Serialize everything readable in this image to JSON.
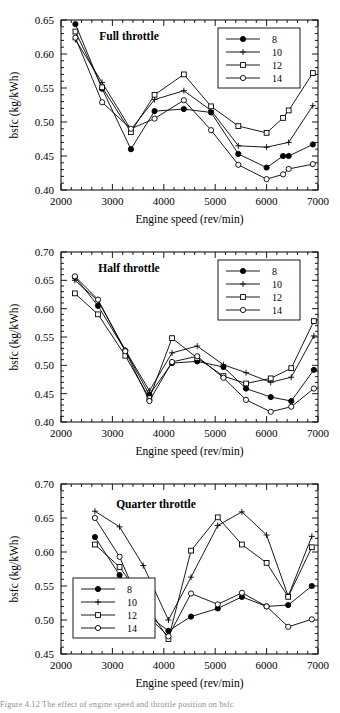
{
  "figure": {
    "caption": "Figure 4.12   The effect of engine speed and throttle position on bsfc"
  },
  "chart_data": [
    {
      "type": "line",
      "title": "Full  throttle",
      "xlabel": "Engine speed (rev/min)",
      "ylabel": "bsfc (kg/kWh)",
      "xlim": [
        2000,
        7000
      ],
      "ylim": [
        0.4,
        0.65
      ],
      "xticks": [
        2000,
        3000,
        4000,
        5000,
        6000,
        7000
      ],
      "yticks": [
        0.4,
        0.45,
        0.5,
        0.55,
        0.6,
        0.65
      ],
      "xticklabels": [
        "2000",
        "3000",
        "4000",
        "5000",
        "6000",
        "7000"
      ],
      "yticklabels": [
        "0.40",
        "0.45",
        "0.50",
        "0.55",
        "0.60",
        "0.65"
      ],
      "grid": false,
      "legend_position": "top-right",
      "series": [
        {
          "name": "8",
          "marker": "filled-circle",
          "x": [
            2280,
            2800,
            3360,
            3820,
            4390,
            4920,
            5450,
            6000,
            6320,
            6430,
            6900
          ],
          "y": [
            0.644,
            0.549,
            0.46,
            0.516,
            0.519,
            0.514,
            0.453,
            0.433,
            0.45,
            0.45,
            0.467
          ]
        },
        {
          "name": "10",
          "marker": "plus",
          "x": [
            2280,
            2800,
            3360,
            3820,
            4390,
            4920,
            5450,
            6000,
            6430,
            6900
          ],
          "y": [
            0.621,
            0.558,
            0.489,
            0.533,
            0.546,
            0.517,
            0.465,
            0.463,
            0.47,
            0.524
          ]
        },
        {
          "name": "12",
          "marker": "square",
          "x": [
            2280,
            2800,
            3360,
            3820,
            4390,
            4920,
            5450,
            6000,
            6320,
            6430,
            6900
          ],
          "y": [
            0.633,
            0.551,
            0.485,
            0.54,
            0.57,
            0.523,
            0.494,
            0.484,
            0.506,
            0.517,
            0.572
          ]
        },
        {
          "name": "14",
          "marker": "open-circle",
          "x": [
            2280,
            2800,
            3360,
            3820,
            4390,
            4920,
            5450,
            6000,
            6320,
            6430,
            6900
          ],
          "y": [
            0.624,
            0.529,
            0.49,
            0.505,
            0.532,
            0.488,
            0.437,
            0.416,
            0.423,
            0.431,
            0.438
          ]
        }
      ]
    },
    {
      "type": "line",
      "title": "Half  throttle",
      "xlabel": "Engine speed (rev/min)",
      "ylabel": "bsfc (kg/kWh)",
      "xlim": [
        2000,
        7000
      ],
      "ylim": [
        0.4,
        0.7
      ],
      "xticks": [
        2000,
        3000,
        4000,
        5000,
        6000,
        7000
      ],
      "yticks": [
        0.4,
        0.45,
        0.5,
        0.55,
        0.6,
        0.65,
        0.7
      ],
      "xticklabels": [
        "2000",
        "3000",
        "4000",
        "5000",
        "6000",
        "7000"
      ],
      "yticklabels": [
        "0.40",
        "0.45",
        "0.50",
        "0.55",
        "0.60",
        "0.65",
        "0.70"
      ],
      "grid": false,
      "legend_position": "top-right",
      "series": [
        {
          "name": "8",
          "marker": "filled-circle",
          "x": [
            2270,
            2720,
            3250,
            3720,
            4160,
            4650,
            5160,
            5600,
            6080,
            6480,
            6920
          ],
          "y": [
            0.656,
            0.605,
            0.526,
            0.448,
            0.504,
            0.507,
            0.497,
            0.459,
            0.444,
            0.437,
            0.492
          ]
        },
        {
          "name": "10",
          "marker": "plus",
          "x": [
            2270,
            2720,
            3250,
            3720,
            4160,
            4650,
            5160,
            5600,
            6080,
            6480,
            6920
          ],
          "y": [
            0.65,
            0.614,
            0.527,
            0.455,
            0.522,
            0.534,
            0.501,
            0.487,
            0.47,
            0.479,
            0.552
          ]
        },
        {
          "name": "12",
          "marker": "square",
          "x": [
            2270,
            2720,
            3250,
            3720,
            4160,
            4650,
            5160,
            5600,
            6080,
            6480,
            6920
          ],
          "y": [
            0.627,
            0.59,
            0.517,
            0.442,
            0.548,
            0.513,
            0.481,
            0.468,
            0.477,
            0.495,
            0.578
          ]
        },
        {
          "name": "14",
          "marker": "open-circle",
          "x": [
            2270,
            2720,
            3250,
            3720,
            4160,
            4650,
            5160,
            5600,
            6080,
            6480,
            6920
          ],
          "y": [
            0.657,
            0.616,
            0.525,
            0.437,
            0.506,
            0.516,
            0.478,
            0.439,
            0.418,
            0.427,
            0.459
          ]
        }
      ]
    },
    {
      "type": "line",
      "title": "Quarter  throttle",
      "xlabel": "Engine speed (rev/min)",
      "ylabel": "bsfc (kg/kWh)",
      "xlim": [
        2000,
        7000
      ],
      "ylim": [
        0.45,
        0.7
      ],
      "xticks": [
        2000,
        3000,
        4000,
        5000,
        6000,
        7000
      ],
      "yticks": [
        0.45,
        0.5,
        0.55,
        0.6,
        0.65,
        0.7
      ],
      "xticklabels": [
        "2000",
        "3000",
        "4000",
        "5000",
        "6000",
        "7000"
      ],
      "yticklabels": [
        "0.45",
        "0.50",
        "0.55",
        "0.60",
        "0.65",
        "0.70"
      ],
      "grid": false,
      "legend_position": "bottom-left",
      "series": [
        {
          "name": "8",
          "marker": "filled-circle",
          "x": [
            2660,
            3140,
            3600,
            4090,
            4530,
            5050,
            5520,
            6000,
            6420,
            6880
          ],
          "y": [
            0.622,
            0.566,
            0.512,
            0.484,
            0.505,
            0.517,
            0.534,
            0.52,
            0.522,
            0.55
          ]
        },
        {
          "name": "10",
          "marker": "plus",
          "x": [
            2660,
            3140,
            3600,
            4090,
            4530,
            5050,
            5520,
            6000,
            6420,
            6880
          ],
          "y": [
            0.66,
            0.637,
            0.58,
            0.5,
            0.563,
            0.639,
            0.659,
            0.625,
            0.535,
            0.623
          ]
        },
        {
          "name": "12",
          "marker": "square",
          "x": [
            2660,
            3140,
            3600,
            4090,
            4530,
            5050,
            5520,
            6000,
            6420,
            6880
          ],
          "y": [
            0.611,
            0.578,
            0.529,
            0.472,
            0.602,
            0.651,
            0.611,
            0.584,
            0.534,
            0.607
          ]
        },
        {
          "name": "14",
          "marker": "open-circle",
          "x": [
            2660,
            3140,
            3600,
            4090,
            4530,
            5050,
            5520,
            6000,
            6420,
            6880
          ],
          "y": [
            0.65,
            0.593,
            0.512,
            0.476,
            0.539,
            0.523,
            0.54,
            0.52,
            0.49,
            0.501
          ]
        }
      ]
    }
  ]
}
